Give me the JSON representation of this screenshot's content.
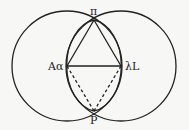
{
  "diagram": {
    "labels": {
      "top": "π",
      "left": "Aα",
      "right": "λL",
      "bottom": "P"
    },
    "colors": {
      "stroke": "#222222",
      "background": "#f7f7f5"
    }
  }
}
